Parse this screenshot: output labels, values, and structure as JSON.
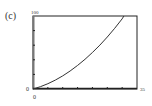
{
  "panel_label": "(c)",
  "chart_data": {
    "type": "line",
    "title": "",
    "xlabel": "",
    "ylabel": "",
    "xlim": [
      0,
      35
    ],
    "ylim": [
      0,
      100
    ],
    "x_tick_labels": {
      "min": "0",
      "max": "35"
    },
    "y_tick_labels": {
      "min": "0",
      "max": "100"
    },
    "x_ticks": [
      0,
      5,
      10,
      15,
      20,
      25,
      30,
      35
    ],
    "y_ticks": [
      0,
      20,
      40,
      60,
      80,
      100
    ],
    "grid": false,
    "series": [
      {
        "name": "curve",
        "x": [
          0,
          2.5,
          5,
          7.5,
          10,
          12.5,
          15,
          17.5,
          20,
          22.5,
          25,
          27.5,
          30,
          30.6
        ],
        "y": [
          0,
          3.2,
          7.3,
          12.2,
          18.0,
          24.7,
          32.3,
          40.7,
          50.0,
          60.2,
          71.3,
          83.2,
          96.0,
          100
        ]
      }
    ]
  }
}
